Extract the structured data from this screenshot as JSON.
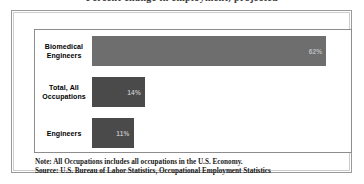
{
  "figure": {
    "title": "Percent change in employment, projected",
    "note_line_1": "Note: All Occupations includes all occupations in the U.S. Economy.",
    "note_line_2": "Source: U.S. Bureau of Labor Statistics, Occupational Employment Statistics",
    "colors": {
      "bar_highlight": "#6e6e6e",
      "bar_default": "#4a4a4a",
      "value_label": "#bdbdbd",
      "frame": "#9a9a9a",
      "plot_border": "#8d8d8d",
      "background": "#ffffff"
    }
  },
  "chart_data": {
    "type": "bar",
    "orientation": "horizontal",
    "title": "Percent change in employment, projected",
    "xlabel": "",
    "ylabel": "",
    "xlim": [
      0,
      68
    ],
    "grid": false,
    "legend": null,
    "categories": [
      "Biomedical Engineers",
      "Total, All Occupations",
      "Engineers"
    ],
    "category_lines": [
      [
        "Biomedical",
        "Engineers"
      ],
      [
        "Total, All",
        "Occupations"
      ],
      [
        "Engineers"
      ]
    ],
    "values": [
      62,
      14,
      11
    ],
    "value_labels": [
      "62%",
      "14%",
      "11%"
    ],
    "bar_colors": [
      "#6e6e6e",
      "#4a4a4a",
      "#4a4a4a"
    ]
  }
}
